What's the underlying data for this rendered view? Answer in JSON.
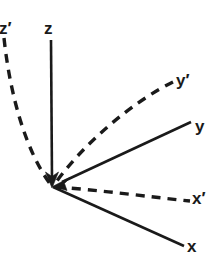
{
  "figure": {
    "kind": "coordinate-axes-diagram",
    "background_color": "#ffffff",
    "stroke_color": "#1a1a1a",
    "width": 212,
    "height": 272,
    "origin": {
      "x": 53,
      "y": 186
    }
  },
  "labels": {
    "z_prime": "z′",
    "z": "z",
    "y_prime": "y′",
    "y": "y",
    "x_prime": "x′",
    "x": "x"
  },
  "axes": [
    {
      "id": "z-axis",
      "label": "z",
      "style": "solid",
      "curved": false,
      "arrow_at_origin": true,
      "tip": {
        "x": 51,
        "y": 40
      },
      "path": "M 51 40 L 52 186"
    },
    {
      "id": "z-prime-axis",
      "label": "z′",
      "style": "dashed",
      "curved": true,
      "arrow_at_origin": false,
      "tip": {
        "x": 4,
        "y": 38
      },
      "path": "M 4 38 C 10 95 26 152 51 185"
    },
    {
      "id": "y-axis",
      "label": "y",
      "style": "solid",
      "curved": false,
      "arrow_at_origin": true,
      "tip": {
        "x": 191,
        "y": 122
      },
      "path": "M 191 122 L 54 186"
    },
    {
      "id": "y-prime-axis",
      "label": "y′",
      "style": "dashed",
      "curved": true,
      "arrow_at_origin": false,
      "tip": {
        "x": 173,
        "y": 82
      },
      "path": "M 173 82 C 132 102 82 145 54 185"
    },
    {
      "id": "x-axis",
      "label": "x",
      "style": "solid",
      "curved": false,
      "arrow_at_origin": false,
      "tip": {
        "x": 184,
        "y": 246
      },
      "path": "M 54 187 L 184 246"
    },
    {
      "id": "x-prime-axis",
      "label": "x′",
      "style": "dashed",
      "curved": true,
      "arrow_at_origin": false,
      "tip": {
        "x": 190,
        "y": 201
      },
      "path": "M 54 187 C 100 190 150 197 190 201"
    }
  ],
  "style_tokens": {
    "solid_width": 2.6,
    "dashed_width": 3.4,
    "dash_pattern": "9 7",
    "label_font_size": 17,
    "label_weight": "bold"
  }
}
